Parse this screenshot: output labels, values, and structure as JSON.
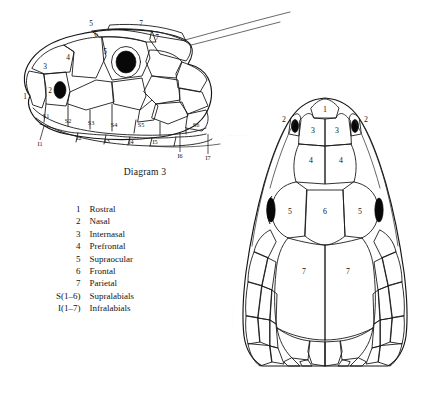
{
  "caption": {
    "text": "Diagram 3"
  },
  "legend": {
    "items": [
      {
        "key": "1",
        "label": "Rostral"
      },
      {
        "key": "2",
        "label": "Nasal"
      },
      {
        "key": "3",
        "label": "Internasal"
      },
      {
        "key": "4",
        "label": "Prefrontal"
      },
      {
        "key": "5",
        "label": "Supraocular"
      },
      {
        "key": "6",
        "label": "Frontal"
      },
      {
        "key": "7",
        "label": "Parietal"
      },
      {
        "key": "S(1–6)",
        "label": "Supralabials"
      },
      {
        "key": "I(1–7)",
        "label": "Infralabials"
      }
    ]
  },
  "lateral_view": {
    "title": "lateral head scalation",
    "labels": {
      "rostral": "1",
      "nasal": "2",
      "internasal": "3",
      "prefrontal": "4",
      "supraocular": "5",
      "frontal": "6",
      "parietal_upper": "7",
      "parietal_lower": "7",
      "supraocular_upper": "5"
    },
    "supralabials": [
      "S1",
      "S2",
      "S3",
      "S4",
      "S5",
      "S6"
    ],
    "infralabials": [
      "I1",
      "I2",
      "I3",
      "I4",
      "I5",
      "I6",
      "I7"
    ]
  },
  "dorsal_view": {
    "title": "dorsal head scalation",
    "labels": {
      "rostral": "1",
      "nasal_left": "2",
      "nasal_right": "2",
      "internasal_left": "3",
      "internasal_right": "3",
      "prefrontal_left": "4",
      "prefrontal_right": "4",
      "supraocular_left": "5",
      "supraocular_right": "5",
      "frontal": "6",
      "parietal_left": "7",
      "parietal_right": "7"
    }
  },
  "artifacts": {
    "lateral_mark": "·· ···· ··· ··",
    "dorsal_upper_mark": "···· ··· ··",
    "dorsal_lower_mark": "··· ···· ··"
  },
  "colors": {
    "background": "#ffffff",
    "ink": "#1b1b1b",
    "eye": "#080808",
    "text": "#141414"
  }
}
